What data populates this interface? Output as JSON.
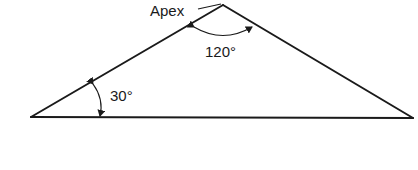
{
  "diagram": {
    "type": "triangle",
    "labels": {
      "apex": "Apex",
      "apex_angle": "120°",
      "base_angle": "30°"
    },
    "angles_deg": {
      "apex": 120,
      "base_left": 30
    },
    "colors": {
      "stroke": "#1a1a1a",
      "background": "#ffffff"
    }
  }
}
